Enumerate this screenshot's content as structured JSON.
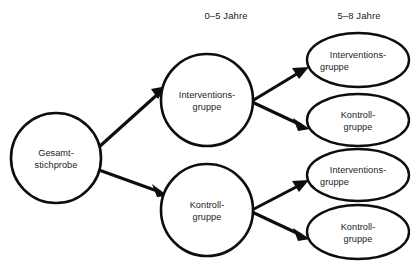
{
  "figure": {
    "type": "flow-diagram",
    "background_color": "#ffffff",
    "line_color": "#0d0d0d",
    "text_color": "#1c1c1c"
  },
  "headers": [
    {
      "label": "0–5 Jahre",
      "x": 226,
      "y": 16
    },
    {
      "label": "5–8 Jahre",
      "x": 359,
      "y": 16
    }
  ],
  "nodes": {
    "root": {
      "id": "gesamtstichprobe",
      "shape": "circle",
      "line1": "Gesamt-",
      "line2": "stichprobe",
      "cx": 56,
      "cy": 158,
      "r": 45
    },
    "stage1": [
      {
        "id": "stage1-intervention",
        "shape": "circle",
        "line1": "Interventions-",
        "line2": "gruppe",
        "cx": 207,
        "cy": 100,
        "r": 46
      },
      {
        "id": "stage1-kontroll",
        "shape": "circle",
        "line1": "Kontroll-",
        "line2": "gruppe",
        "cx": 207,
        "cy": 210,
        "r": 46
      }
    ],
    "stage2": [
      {
        "id": "stage2-intervention-a",
        "shape": "ellipse",
        "line1": "Interventions-",
        "line2": "gruppe",
        "cx": 358,
        "cy": 60,
        "rx": 51,
        "ry": 27
      },
      {
        "id": "stage2-kontroll-a",
        "shape": "ellipse",
        "line1": "Kontroll-",
        "line2": "gruppe",
        "cx": 358,
        "cy": 120,
        "rx": 51,
        "ry": 26
      },
      {
        "id": "stage2-intervention-b",
        "shape": "ellipse",
        "line1": "Interventions-",
        "line2": "gruppe",
        "cx": 358,
        "cy": 175,
        "rx": 51,
        "ry": 26
      },
      {
        "id": "stage2-kontroll-b",
        "shape": "ellipse",
        "line1": "Kontroll-",
        "line2": "gruppe",
        "cx": 358,
        "cy": 232,
        "rx": 51,
        "ry": 27
      }
    ]
  },
  "edges": [
    {
      "id": "edge-root-to-intervention",
      "from": "gesamtstichprobe",
      "to": "stage1-intervention",
      "x1": 99,
      "y1": 147,
      "x2": 166,
      "y2": 87
    },
    {
      "id": "edge-root-to-kontroll",
      "from": "gesamtstichprobe",
      "to": "stage1-kontroll",
      "x1": 99,
      "y1": 170,
      "x2": 167,
      "y2": 196
    },
    {
      "id": "edge-intervention-to-intervention",
      "from": "stage1-intervention",
      "to": "stage2-intervention-a",
      "x1": 253,
      "y1": 100,
      "x2": 307,
      "y2": 68
    },
    {
      "id": "edge-intervention-to-kontroll",
      "from": "stage1-intervention",
      "to": "stage2-kontroll-a",
      "x1": 253,
      "y1": 102,
      "x2": 308,
      "y2": 128
    },
    {
      "id": "edge-kontroll-to-intervention",
      "from": "stage1-kontroll",
      "to": "stage2-intervention-b",
      "x1": 253,
      "y1": 209,
      "x2": 307,
      "y2": 181
    },
    {
      "id": "edge-kontroll-to-kontroll",
      "from": "stage1-kontroll",
      "to": "stage2-kontroll-b",
      "x1": 253,
      "y1": 212,
      "x2": 308,
      "y2": 238
    }
  ]
}
